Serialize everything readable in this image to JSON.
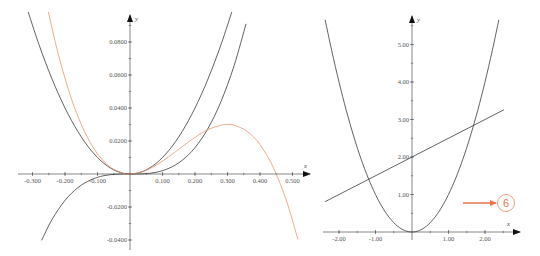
{
  "colors": {
    "black_curve": "#3a3a3a",
    "orange_curve": "#e8956f",
    "annotation": "#e8734a",
    "axis": "#555555"
  },
  "chart_data": [
    {
      "type": "line",
      "title": "",
      "xlabel": "x",
      "ylabel": "y",
      "xlim": [
        -0.32,
        0.55
      ],
      "ylim": [
        -0.045,
        0.095
      ],
      "grid": false,
      "legend": null,
      "x_ticks": [
        "-0.300",
        "-0.200",
        "-0.100",
        "0.100",
        "0.200",
        "0.300",
        "0.400",
        "0.500"
      ],
      "x_tick_values": [
        -0.3,
        -0.2,
        -0.1,
        0.1,
        0.2,
        0.3,
        0.4,
        0.5
      ],
      "y_ticks": [
        "0.0800",
        "0.0600",
        "0.0400",
        "0.0200",
        "-0.0200",
        "-0.0400"
      ],
      "y_tick_values": [
        0.08,
        0.06,
        0.04,
        0.02,
        -0.02,
        -0.04
      ],
      "series": [
        {
          "name": "y = x^2",
          "color": "black",
          "x": [
            -0.317,
            -0.28,
            -0.24,
            -0.2,
            -0.16,
            -0.12,
            -0.08,
            -0.04,
            0,
            0.04,
            0.08,
            0.12,
            0.16,
            0.2,
            0.24,
            0.28,
            0.317
          ],
          "y": [
            0.1005,
            0.0784,
            0.0576,
            0.04,
            0.0256,
            0.0144,
            0.0064,
            0.0016,
            0,
            0.0016,
            0.0064,
            0.0144,
            0.0256,
            0.04,
            0.0576,
            0.0784,
            0.1005
          ]
        },
        {
          "name": "y = 2x^3",
          "color": "black",
          "x": [
            -0.272,
            -0.24,
            -0.2,
            -0.16,
            -0.12,
            -0.08,
            -0.04,
            0,
            0.04,
            0.08,
            0.12,
            0.16,
            0.2,
            0.24,
            0.28,
            0.32,
            0.357
          ],
          "y": [
            -0.0402,
            -0.0276,
            -0.016,
            -0.0082,
            -0.0035,
            -0.001,
            -0.0001,
            0,
            0.0001,
            0.001,
            0.0035,
            0.0082,
            0.016,
            0.0276,
            0.0439,
            0.0655,
            0.091
          ]
        },
        {
          "name": "y = x^2 - (20/9)x^3",
          "color": "orange",
          "x": [
            -0.252,
            -0.22,
            -0.18,
            -0.14,
            -0.1,
            -0.06,
            -0.02,
            0,
            0.04,
            0.08,
            0.12,
            0.16,
            0.2,
            0.24,
            0.28,
            0.3,
            0.32,
            0.36,
            0.4,
            0.44,
            0.48,
            0.517
          ],
          "y": [
            0.0991,
            0.0721,
            0.0454,
            0.0257,
            0.0122,
            0.0041,
            0.0004,
            0,
            0.0015,
            0.0053,
            0.0106,
            0.0165,
            0.0222,
            0.0269,
            0.0296,
            0.03,
            0.0296,
            0.0259,
            0.0178,
            0.0043,
            -0.0154,
            -0.0398
          ]
        }
      ]
    },
    {
      "type": "line",
      "title": "",
      "xlabel": "x",
      "ylabel": "y",
      "xlim": [
        -2.4,
        2.9
      ],
      "ylim": [
        0,
        5.7
      ],
      "grid": false,
      "legend": null,
      "x_ticks": [
        "-2.00",
        "-1.00",
        "1.00",
        "2.00"
      ],
      "x_tick_values": [
        -2,
        -1,
        1,
        2
      ],
      "y_ticks": [
        "5.00",
        "4.00",
        "3.00",
        "2.00",
        "1.00"
      ],
      "y_tick_values": [
        5,
        4,
        3,
        2,
        1
      ],
      "series": [
        {
          "name": "y = x^2",
          "color": "black",
          "x": [
            -2.38,
            -2.2,
            -2.0,
            -1.8,
            -1.6,
            -1.4,
            -1.2,
            -1.0,
            -0.8,
            -0.6,
            -0.4,
            -0.2,
            0,
            0.2,
            0.4,
            0.6,
            0.8,
            1.0,
            1.2,
            1.4,
            1.6,
            1.8,
            2.0,
            2.2,
            2.38
          ],
          "y": [
            5.66,
            4.84,
            4.0,
            3.24,
            2.56,
            1.96,
            1.44,
            1.0,
            0.64,
            0.36,
            0.16,
            0.04,
            0,
            0.04,
            0.16,
            0.36,
            0.64,
            1.0,
            1.44,
            1.96,
            2.56,
            3.24,
            4.0,
            4.84,
            5.66
          ]
        },
        {
          "name": "y = 0.5x + 2",
          "color": "black",
          "x": [
            -2.38,
            2.52
          ],
          "y": [
            0.81,
            3.26
          ]
        }
      ],
      "annotations": [
        {
          "type": "arrow",
          "color": "orange",
          "label": "6"
        }
      ]
    }
  ],
  "annotation": {
    "circle_label": "6"
  },
  "axis_names": {
    "x": "x",
    "y": "y"
  }
}
